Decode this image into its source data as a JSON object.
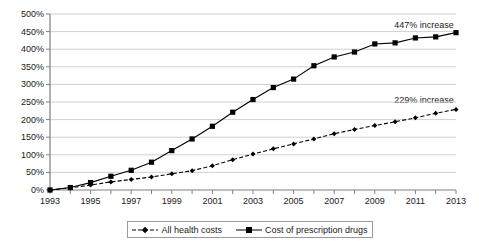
{
  "chart_data": {
    "type": "line",
    "title": "",
    "xlabel": "",
    "ylabel": "",
    "x": [
      1993,
      1994,
      1995,
      1996,
      1997,
      1998,
      1999,
      2000,
      2001,
      2002,
      2003,
      2004,
      2005,
      2006,
      2007,
      2008,
      2009,
      2010,
      2011,
      2012,
      2013
    ],
    "xlim": [
      1993,
      2013
    ],
    "ylim": [
      0,
      500
    ],
    "ytick_labels": [
      "0%",
      "50%",
      "100%",
      "150%",
      "200%",
      "250%",
      "300%",
      "350%",
      "400%",
      "450%",
      "500%"
    ],
    "ytick_values": [
      0,
      50,
      100,
      150,
      200,
      250,
      300,
      350,
      400,
      450,
      500
    ],
    "xtick_labels": [
      "1993",
      "1995",
      "1997",
      "1999",
      "2001",
      "2003",
      "2005",
      "2007",
      "2009",
      "2011",
      "2013"
    ],
    "xtick_values": [
      1993,
      1995,
      1997,
      1999,
      2001,
      2003,
      2005,
      2007,
      2009,
      2011,
      2013
    ],
    "grid": "horizontal",
    "legend_position": "bottom",
    "series": [
      {
        "name": "All health costs",
        "marker": "diamond",
        "line_style": "dashed",
        "color": "#000000",
        "values": [
          0,
          6,
          14,
          23,
          30,
          37,
          46,
          55,
          69,
          86,
          102,
          117,
          131,
          145,
          160,
          172,
          183,
          194,
          205,
          218,
          229
        ]
      },
      {
        "name": "Cost of prescription drugs",
        "marker": "square",
        "line_style": "solid",
        "color": "#000000",
        "values": [
          0,
          7,
          21,
          39,
          56,
          79,
          112,
          145,
          181,
          221,
          257,
          291,
          315,
          353,
          378,
          392,
          415,
          418,
          432,
          435,
          447
        ]
      }
    ],
    "annotations": [
      {
        "text": "447% increase",
        "series": "Cost of prescription drugs",
        "x": 2012,
        "y": 470
      },
      {
        "text": "229% increase",
        "series": "All health costs",
        "x": 2012,
        "y": 255
      }
    ]
  },
  "legend": {
    "items": [
      {
        "label": "All health costs"
      },
      {
        "label": "Cost of prescription drugs"
      }
    ]
  }
}
